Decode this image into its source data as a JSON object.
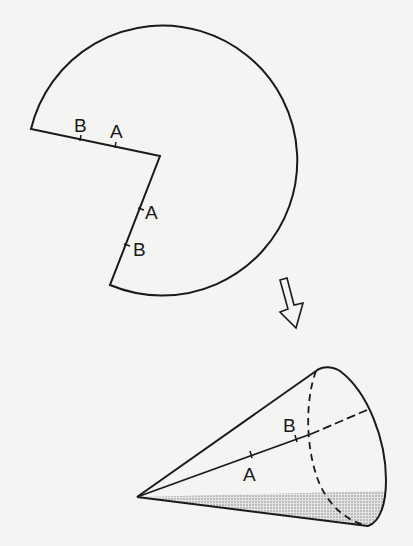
{
  "figure": {
    "flat_sector": {
      "edge1_labels": [
        "B",
        "A"
      ],
      "edge2_labels": [
        "A",
        "B"
      ]
    },
    "arrow": {
      "direction": "down"
    },
    "cone": {
      "labels": [
        "B",
        "A"
      ],
      "shaded_region": "base seam area"
    }
  },
  "labels": {
    "sector_B1": "B",
    "sector_A1": "A",
    "sector_A2": "A",
    "sector_B2": "B",
    "cone_B": "B",
    "cone_A": "A"
  },
  "colors": {
    "stroke": "#1a1a1a",
    "background": "#f4f4f2",
    "shade": "#bdbdbd"
  }
}
